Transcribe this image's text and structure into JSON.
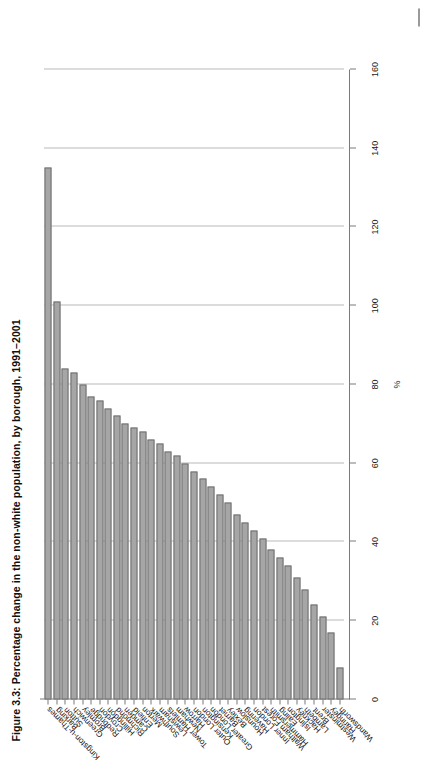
{
  "figure": {
    "title": "Figure 3.3: Percentage change in the non-white population, by borough, 1991–2001"
  },
  "chart_data": {
    "type": "bar",
    "orientation": "horizontal",
    "title": "Figure 3.3: Percentage change in the non-white population, by borough, 1991–2001",
    "xlabel": "%",
    "ylabel": "",
    "xlim": [
      0,
      160
    ],
    "xticks": [
      0,
      20,
      40,
      60,
      80,
      100,
      120,
      140,
      160
    ],
    "xticklabels": [
      "0",
      "20",
      "40",
      "60",
      "80",
      "100",
      "120",
      "140",
      "160"
    ],
    "grid": "vertical",
    "legend": "none",
    "bar_color": "#a6a6a6",
    "bar_edge_color": "#6f6f6f",
    "categories": [
      "Kingston-u-Thames",
      "Barking",
      "Sutton",
      "Greenwich",
      "Bromley",
      "Redbridge",
      "Croydon",
      "Hillingdon",
      "Richmond",
      "Camden",
      "Enfield",
      "Merton",
      "Southwark",
      "Lewisham",
      "Tower Hamlets",
      "Newham",
      "Harrow",
      "Outer London",
      "Kensington",
      "Greater London",
      "Barnet",
      "Bexley",
      "Hounslow",
      "Havering",
      "Inner London",
      "Waltham Forest",
      "Hammersmith",
      "Ealing",
      "Islington",
      "Hackney",
      "Lambeth",
      "Brent",
      "Westminster",
      "Haringey",
      "Wandsworth"
    ],
    "values": [
      135,
      101,
      84,
      83,
      80,
      77,
      76,
      74,
      72,
      70,
      69,
      68,
      66,
      65,
      63,
      62,
      60,
      58,
      56,
      54,
      52,
      50,
      47,
      45,
      43,
      41,
      38,
      36,
      34,
      31,
      28,
      24,
      21,
      17,
      8
    ]
  }
}
